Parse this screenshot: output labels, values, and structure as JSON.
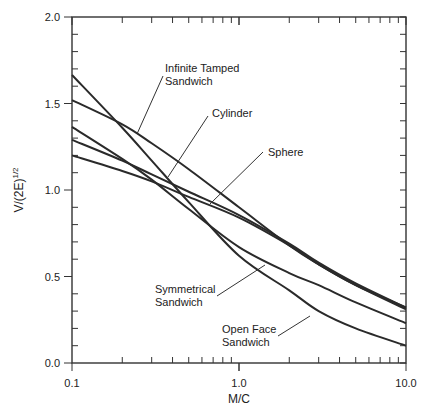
{
  "chart_data": {
    "type": "line",
    "title": "",
    "xlabel": "M/C",
    "ylabel": "V/(2E)^1/2",
    "ylabel_parts": {
      "base": "V/(2E)",
      "sup": "1/2"
    },
    "xscale": "log",
    "xlim": [
      0.1,
      10.0
    ],
    "ylim": [
      0.0,
      2.0
    ],
    "xticks": [
      "0.1",
      "1.0",
      "10.0"
    ],
    "yticks": [
      "0.0",
      "0.5",
      "1.0",
      "1.5",
      "2.0"
    ],
    "grid": false,
    "legend": "inline-annotations",
    "x": [
      0.1,
      0.2,
      0.3,
      0.5,
      1.0,
      2.0,
      3.0,
      5.0,
      10.0
    ],
    "series": [
      {
        "name": "Infinite Tamped Sandwich",
        "values": [
          1.52,
          1.38,
          1.27,
          1.12,
          0.9,
          0.68,
          0.57,
          0.45,
          0.32
        ]
      },
      {
        "name": "Cylinder",
        "values": [
          1.29,
          1.17,
          1.09,
          0.99,
          0.855,
          0.69,
          0.58,
          0.46,
          0.32
        ]
      },
      {
        "name": "Sphere",
        "values": [
          1.2,
          1.11,
          1.05,
          0.96,
          0.84,
          0.68,
          0.57,
          0.45,
          0.31
        ]
      },
      {
        "name": "Symmetrical Sandwich",
        "values": [
          1.365,
          1.18,
          1.06,
          0.89,
          0.67,
          0.52,
          0.45,
          0.35,
          0.23
        ]
      },
      {
        "name": "Open Face Sandwich",
        "values": [
          1.665,
          1.36,
          1.17,
          0.93,
          0.62,
          0.42,
          0.3,
          0.2,
          0.1
        ]
      }
    ],
    "annotations": [
      {
        "text_lines": [
          "Infinite Tamped",
          "Sandwich"
        ],
        "series": "Infinite Tamped Sandwich"
      },
      {
        "text_lines": [
          "Cylinder"
        ],
        "series": "Cylinder"
      },
      {
        "text_lines": [
          "Sphere"
        ],
        "series": "Sphere"
      },
      {
        "text_lines": [
          "Symmetrical",
          "Sandwich"
        ],
        "series": "Symmetrical Sandwich"
      },
      {
        "text_lines": [
          "Open Face",
          "Sandwich"
        ],
        "series": "Open Face Sandwich"
      }
    ]
  }
}
